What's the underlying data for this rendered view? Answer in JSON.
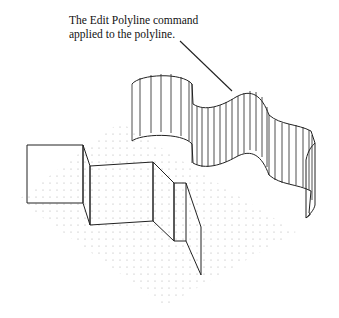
{
  "figure": {
    "callout": {
      "line1": "The Edit Polyline command",
      "line2": "applied to the polyline."
    },
    "colors": {
      "background": "#ffffff",
      "line": "#222222",
      "grid_dot": "#a8a8a8",
      "text": "#111111"
    },
    "elements": [
      "dot-grid-plane",
      "original-extruded-polyline",
      "curve-fit-extruded-polyline",
      "callout-leader"
    ]
  }
}
